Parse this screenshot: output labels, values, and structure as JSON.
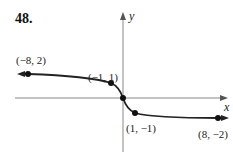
{
  "problem_number": "48.",
  "axes": {
    "x_label": "x",
    "y_label": "y"
  },
  "points": [
    {
      "label": "(−8, 2)",
      "x": -8,
      "y": 2
    },
    {
      "label": "(−1, 1)",
      "x": -1,
      "y": 1
    },
    {
      "label": "(1, −1)",
      "x": 1,
      "y": -1
    },
    {
      "label": "(8, −2)",
      "x": 8,
      "y": -2
    }
  ],
  "origin": {
    "x": 0,
    "y": 0
  },
  "colors": {
    "stroke": "#222222",
    "axis": "#888888"
  }
}
